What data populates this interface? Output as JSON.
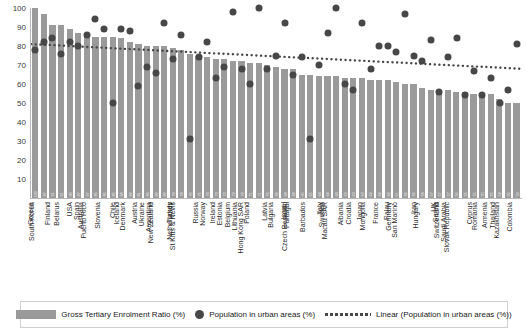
{
  "chart_data": {
    "type": "bar",
    "title": "",
    "xlabel": "",
    "ylabel": "",
    "ylim": [
      0,
      100
    ],
    "yticks": [
      10,
      20,
      30,
      40,
      50,
      60,
      70,
      80,
      90,
      100
    ],
    "grid": false,
    "legend_position": "bottom",
    "categories": [
      "Greece",
      "South Korea",
      "Finland",
      "Belarus",
      "USA",
      "Spain",
      "Australia",
      "Puerto Rico",
      "Slovenia",
      "Chile",
      "Iceland",
      "Denmark",
      "Austria",
      "Ukraine",
      "Argentina",
      "New Zealand",
      "Turkey",
      "Netherlands",
      "St Kitts & Nevis",
      "Russia",
      "Norway",
      "Ireland",
      "Estonia",
      "Belgium",
      "Lithuania",
      "Poland",
      "Hong Kong SAR",
      "Latvia",
      "Bulgaria",
      "Israel",
      "Portugal",
      "Czech Republic",
      "Barbados",
      "Italy",
      "Sweden",
      "Macau SAR",
      "Albania",
      "Croatia",
      "Japan",
      "Mongolia",
      "France",
      "Palau",
      "Germany",
      "San Marino",
      "Iran",
      "Hungary",
      "UK",
      "Serbia",
      "Switzerland",
      "Saudi Arabia",
      "Slovak Republic",
      "Cyprus",
      "Romania",
      "Armenia",
      "Thailand",
      "Kazakhstan",
      "Colombia"
    ],
    "series": [
      {
        "name": "Gross Tertiary Enrolment Ratio (%)",
        "type": "bar",
        "color": "#9a9a9a",
        "values": [
          100,
          97,
          91,
          91,
          89,
          87,
          87,
          85,
          85,
          85,
          84,
          82,
          81,
          80,
          80,
          80,
          79,
          78,
          76,
          75,
          74,
          73,
          73,
          72,
          72,
          71,
          71,
          70,
          69,
          68,
          68,
          65,
          65,
          64,
          64,
          64,
          63,
          63,
          63,
          62,
          62,
          62,
          61,
          60,
          60,
          58,
          57,
          57,
          57,
          56,
          56,
          55,
          55,
          55,
          52,
          50,
          50
        ]
      },
      {
        "name": "Population in urban areas (%)",
        "type": "scatter",
        "color": "#474747",
        "values": [
          78,
          82,
          84,
          76,
          82,
          80,
          86,
          94,
          89,
          50,
          89,
          88,
          59,
          69,
          66,
          92,
          73,
          86,
          31,
          74,
          82,
          63,
          69,
          98,
          68,
          60,
          100,
          68,
          75,
          92,
          65,
          74,
          31,
          70,
          87,
          100,
          60,
          57,
          92,
          68,
          80,
          80,
          77,
          97,
          75,
          72,
          83,
          56,
          74,
          84,
          54,
          67,
          54,
          63,
          50,
          57,
          81
        ]
      },
      {
        "name": "Linear (Population in urban areas (%))",
        "type": "line",
        "style": "dotted",
        "color": "#474747",
        "trend_start": 81,
        "trend_end": 68
      }
    ]
  },
  "legend": {
    "items": [
      {
        "label": "Gross Tertiary Enrolment Ratio (%)",
        "marker": "bar-swatch"
      },
      {
        "label": "Population in urban areas (%)",
        "marker": "dot-swatch"
      },
      {
        "label": "Linear (Population in urban areas (%))",
        "marker": "dotted-line-swatch"
      }
    ]
  }
}
